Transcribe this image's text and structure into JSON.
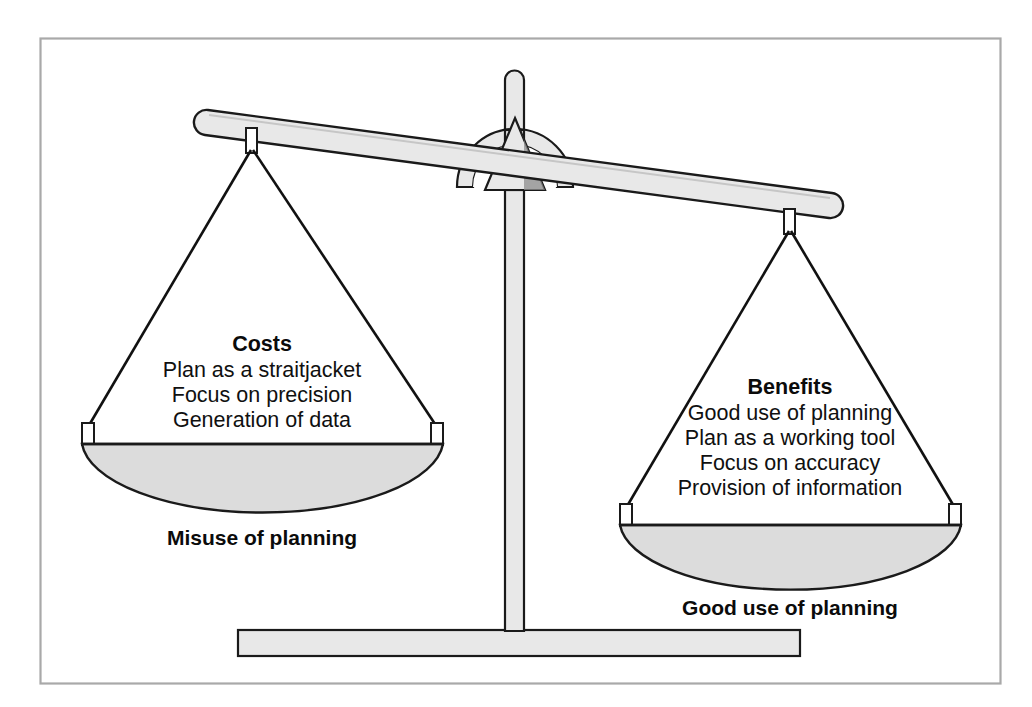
{
  "figure": {
    "kind": "balance-scale-diagram",
    "title_visible": false,
    "background_color": "#ffffff",
    "border_color": "#a8a8a8",
    "metal_fill": "#e8e8e8",
    "pan_fill": "#dcdcdc",
    "outline_color": "#1a1a1a",
    "string_color": "#111111"
  },
  "left_pan": {
    "heading": "Costs",
    "items": [
      "Plan as a straitjacket",
      "Focus on precision",
      "Generation of data"
    ],
    "caption": "Misuse of planning"
  },
  "right_pan": {
    "heading": "Benefits",
    "items": [
      "Good use of planning",
      "Plan as a working tool",
      "Focus on accuracy",
      "Provision of information"
    ],
    "caption": "Good use of planning"
  },
  "parts": {
    "beam_label": "balance-beam",
    "post_label": "center-post",
    "base_label": "base-bar",
    "fulcrum_label": "fulcrum-dome",
    "pointer_label": "fulcrum-pointer"
  }
}
